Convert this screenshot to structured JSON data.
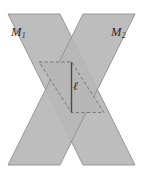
{
  "figure": {
    "kind": "geometry-diagram",
    "background_color": "#ffffff",
    "plane_fill_color": "#b7b7b7",
    "plane_stroke_color": "#8f8f8f",
    "dashed_edge_color": "#6e6e6e",
    "line_color": "#4a4a4a",
    "label_color": "#2b2b2b",
    "labels": {
      "plane_one": {
        "base": "M",
        "subscript": "1",
        "name": "plane-m1-label"
      },
      "plane_two": {
        "base": "M",
        "subscript": "2",
        "name": "plane-m2-label"
      },
      "intersection_line": {
        "symbol": "ℓ",
        "name": "line-ell-label"
      }
    },
    "geometry": {
      "canvas_width": 143,
      "canvas_height": 175,
      "plane_one_points": "8,14 60,14 135,165 83,165",
      "plane_two_points": "83,14 135,14 60,165 8,165",
      "intersection_rhombus": "71.5,62 104,112.5 71.5,112.5 39,62",
      "intersection_dashed_path": "M 39,62 L 71.5,62 L 104,112.5 L 71.5,112.5 Z",
      "line_ell_path": "M 71.5,62 L 71.5,112.5",
      "line_ell_x": 71.5,
      "line_ell_top_y": 62,
      "line_ell_bottom_y": 112.5
    }
  }
}
